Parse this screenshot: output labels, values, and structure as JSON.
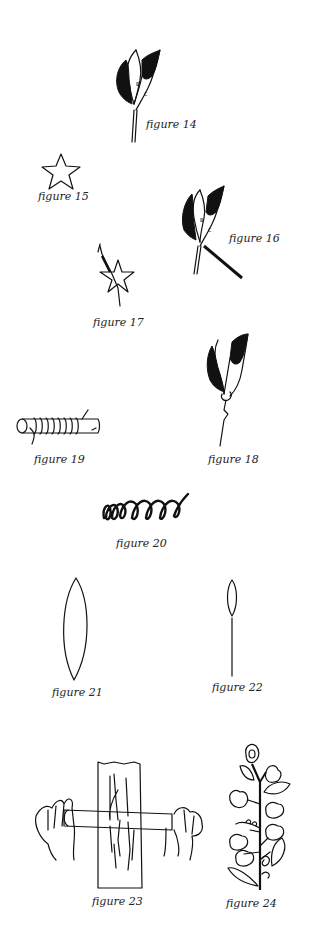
{
  "page": {
    "background": "#ffffff",
    "ink_color": "#111111"
  },
  "figures": [
    {
      "id": 14,
      "caption": "figure 14",
      "subject": "folded-paper-flower-petals",
      "petal_labels": [
        "A",
        "B",
        "C"
      ]
    },
    {
      "id": 15,
      "caption": "figure 15",
      "subject": "five-point-star-calyx"
    },
    {
      "id": 16,
      "caption": "figure 16",
      "subject": "petals-with-tool-attached",
      "petal_labels": [
        "A",
        "B",
        "C"
      ]
    },
    {
      "id": 17,
      "caption": "figure 17",
      "subject": "star-calyx-on-stem"
    },
    {
      "id": 18,
      "caption": "figure 18",
      "subject": "assembled-flower-on-stem"
    },
    {
      "id": 19,
      "caption": "figure 19",
      "subject": "wire-wrapped-around-dowel"
    },
    {
      "id": 20,
      "caption": "figure 20",
      "subject": "coiled-wire-spring"
    },
    {
      "id": 21,
      "caption": "figure 21",
      "subject": "pointed-oval-leaf-shape"
    },
    {
      "id": 22,
      "caption": "figure 22",
      "subject": "small-leaf-on-wire-stem"
    },
    {
      "id": 23,
      "caption": "figure 23",
      "subject": "hands-rolling-dowel-over-wood"
    },
    {
      "id": 24,
      "caption": "figure 24",
      "subject": "finished-flower-branch"
    }
  ]
}
